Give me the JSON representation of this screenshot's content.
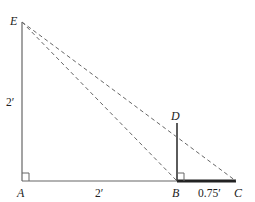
{
  "diagram": {
    "points": {
      "E": {
        "label": "E",
        "x": 22,
        "y": 22
      },
      "A": {
        "label": "A",
        "x": 22,
        "y": 181
      },
      "B": {
        "label": "B",
        "x": 177,
        "y": 181
      },
      "C": {
        "label": "C",
        "x": 236,
        "y": 181
      },
      "D": {
        "label": "D",
        "x": 177,
        "y": 123
      }
    },
    "measurements": {
      "AE": "2′",
      "AB": "2′",
      "BC": "0.75′"
    },
    "colors": {
      "line": "#555555",
      "thick": "#222222",
      "text": "#222222"
    }
  }
}
